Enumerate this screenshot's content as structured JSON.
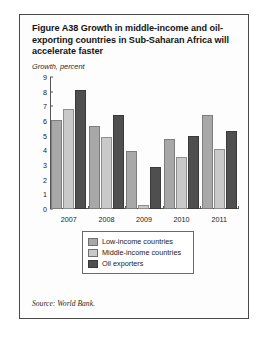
{
  "figure": {
    "title": "Figure A38  Growth in middle-income and oil-exporting countries in Sub-Saharan Africa will accelerate faster",
    "axis_note": "Growth, percent",
    "source": "Source: World Bank."
  },
  "legend": {
    "items": [
      {
        "label": "Low-income countries",
        "color": "#a8a8a8"
      },
      {
        "label": "Middle-income countries",
        "color": "#c9c9c9"
      },
      {
        "label": "Oil exporters",
        "color": "#4f4f4f"
      }
    ]
  },
  "chart_data": {
    "type": "bar",
    "title": "Figure A38  Growth in middle-income and oil-exporting countries in Sub-Saharan Africa will accelerate faster",
    "subtitle": "Growth, percent",
    "xlabel": "",
    "ylabel": "Growth, percent",
    "ylim": [
      0,
      9
    ],
    "yticks": [
      0,
      1,
      2,
      3,
      4,
      5,
      6,
      7,
      8,
      9
    ],
    "grid": false,
    "legend_position": "bottom",
    "categories": [
      "2007",
      "2008",
      "2009",
      "2010",
      "2011"
    ],
    "series": [
      {
        "name": "Low-income countries",
        "color": "#a8a8a8",
        "values": [
          5.9,
          5.55,
          3.8,
          4.65,
          6.25
        ]
      },
      {
        "name": "Middle-income countries",
        "color": "#c9c9c9",
        "values": [
          6.65,
          4.8,
          0.15,
          3.4,
          3.95
        ]
      },
      {
        "name": "Oil exporters",
        "color": "#4f4f4f",
        "values": [
          7.95,
          6.25,
          2.75,
          4.85,
          5.15
        ]
      }
    ],
    "source": "Source: World Bank."
  }
}
